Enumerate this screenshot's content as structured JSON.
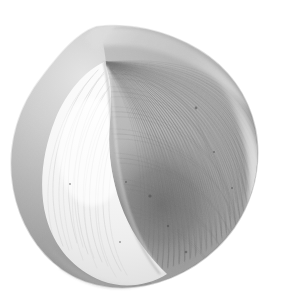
{
  "image": {
    "kind": "photograph",
    "subject": "seashell",
    "subject_detail": "bivalve clam shell, single valve seen from the interior-left with the ribbed exterior curving to the right",
    "orientation": "oblique, long axis tilted about 25 degrees counter-clockwise from horizontal",
    "background": "plain white studio background, no shadow cast",
    "lighting": "soft diffuse light from the upper left",
    "color_mode": "grayscale",
    "width": 281,
    "height": 298,
    "text_content": "none",
    "alt_text": "Grayscale photograph of an ovoid bivalve seashell on a white background, its pale inner lip at lower left and finely ribbed gray outer surface sweeping to the right"
  },
  "palette": {
    "background": "#ffffff",
    "highlight": "#fbfbfb",
    "inner_valve_light": "#f2f2f2",
    "inner_valve_mid": "#e2e2e2",
    "rim_light": "#d2d2d2",
    "dorsal_ridge": "#c0c0c0",
    "outer_valve_light": "#c8c8c8",
    "outer_valve_mid": "#a6a6a6",
    "outer_valve_dark": "#8a8a8a",
    "shadow_core": "#6e6e6e",
    "edge_line": "#5a5a5a",
    "speckle": "#4a4a4a"
  },
  "geometry": {
    "shell_bounds": {
      "left": 10,
      "top": 22,
      "right": 258,
      "bottom": 288
    },
    "umbo": {
      "x": 96,
      "y": 56
    },
    "inner_lobe_center": {
      "x": 92,
      "y": 168
    },
    "dark_core_center": {
      "x": 162,
      "y": 205
    },
    "rib_origin": {
      "x": 104,
      "y": 62
    },
    "rib_count": 46
  },
  "regions": [
    {
      "name": "dorsal-ridge",
      "tone": "#c0c0c0",
      "description": "upper margin ridge running from the umbo toward the upper right with fine concentric growth lines"
    },
    {
      "name": "umbo-notch",
      "tone": "#d6d6d6",
      "description": "small stepped notch at the hinge near the top left of the shell"
    },
    {
      "name": "inner-valve-lobe",
      "tone": "#f2f2f2",
      "description": "bright teardrop-shaped inner lip occupying the left and lower-left of the shell"
    },
    {
      "name": "outer-valve-field",
      "tone": "#a6a6a6",
      "description": "mid-gray ribbed exterior filling the centre and right of the shell"
    },
    {
      "name": "shadow-core",
      "tone": "#6e6e6e",
      "description": "darkest band in the lower centre where the valve curves away from the light"
    },
    {
      "name": "right-margin-rim",
      "tone": "#d2d2d2",
      "description": "lighter catch-light along the curved right-hand shell margin"
    },
    {
      "name": "ventral-margin",
      "tone": "#9a9a9a",
      "description": "lower edge of the shell sweeping from lower left to lower right"
    }
  ],
  "speckles": [
    {
      "x": 196,
      "y": 108,
      "r": 1.4
    },
    {
      "x": 214,
      "y": 152,
      "r": 1.1
    },
    {
      "x": 150,
      "y": 196,
      "r": 1.6
    },
    {
      "x": 168,
      "y": 226,
      "r": 1.2
    },
    {
      "x": 186,
      "y": 252,
      "r": 1.3
    },
    {
      "x": 126,
      "y": 182,
      "r": 1.0
    },
    {
      "x": 232,
      "y": 188,
      "r": 1.0
    },
    {
      "x": 206,
      "y": 268,
      "r": 1.2
    },
    {
      "x": 70,
      "y": 184,
      "r": 0.9
    },
    {
      "x": 120,
      "y": 242,
      "r": 0.9
    }
  ]
}
